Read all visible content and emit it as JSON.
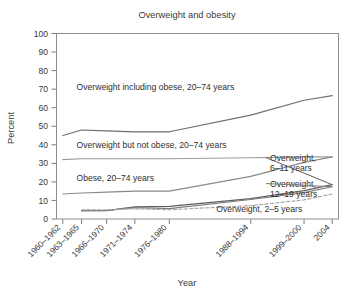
{
  "chart_data": {
    "type": "line",
    "title": "Overweight and obesity",
    "xlabel": "Year",
    "ylabel": "Percent",
    "ylim": [
      0,
      100
    ],
    "ytick_step": 10,
    "yticks": [
      "0",
      "10",
      "20",
      "30",
      "40",
      "50",
      "60",
      "70",
      "80",
      "90",
      "100"
    ],
    "grid": false,
    "legend_position": "inline-annotations",
    "categories": [
      "1960–1962",
      "1963–1965",
      "1966–1970",
      "1971–1974",
      "1976–1980",
      "1988–1994",
      "1999–2000",
      "2004"
    ],
    "x_positions": [
      1961,
      1964,
      1968,
      1972.5,
      1978,
      1991,
      1999.5,
      2004
    ],
    "xlim": [
      1960,
      2005
    ],
    "series": [
      {
        "name": "Overweight including obese, 20–74 years",
        "style": "solid",
        "color": "#6e6e6e",
        "x": [
          1961,
          1964,
          1968,
          1972.5,
          1978,
          1991,
          1999.5,
          2004
        ],
        "values": [
          45,
          48,
          47.5,
          47,
          47,
          56,
          64,
          66.5
        ]
      },
      {
        "name": "Overweight but not obese, 20–74 years",
        "style": "solid",
        "color": "#9a9a9a",
        "x": [
          1961,
          1964,
          1968,
          1972.5,
          1978,
          1991,
          1999.5,
          2004
        ],
        "values": [
          32,
          32.5,
          32.5,
          32.5,
          32.5,
          33,
          33.5,
          33.5
        ]
      },
      {
        "name": "Obese, 20–74 years",
        "style": "solid",
        "color": "#8a8a8a",
        "x": [
          1961,
          1964,
          1968,
          1972.5,
          1978,
          1991,
          1999.5,
          2004
        ],
        "values": [
          13.5,
          14,
          14.5,
          15,
          15,
          23,
          30.5,
          33.5
        ]
      },
      {
        "name": "Overweight, 6–11 years",
        "style": "solid",
        "color": "#5d5d5d",
        "x": [
          1964,
          1968,
          1972.5,
          1978,
          1991,
          1999.5,
          2004
        ],
        "values": [
          4.5,
          4.5,
          6.5,
          6.8,
          11,
          15.3,
          18.5
        ]
      },
      {
        "name": "Overweight, 12–19 years",
        "style": "solid",
        "color": "#7d7d7d",
        "x": [
          1964,
          1968,
          1972.5,
          1978,
          1991,
          1999.5,
          2004
        ],
        "values": [
          4.5,
          4.6,
          6.1,
          5.6,
          10.5,
          14.2,
          17.4
        ]
      },
      {
        "name": "Overweight, 2–5 years",
        "style": "dashed",
        "color": "#a5a5a5",
        "x": [
          1964,
          1968,
          1972.5,
          1978,
          1991,
          1999.5,
          2004
        ],
        "values": [
          5,
          5,
          5.5,
          5,
          7.2,
          10.3,
          13.5
        ]
      }
    ],
    "annotations": [
      {
        "text": "Overweight including obese, 20–74 years",
        "x": 1963.2,
        "y": 69.5,
        "anchor": "start"
      },
      {
        "text": "Overweight but not obese, 20–74 years",
        "x": 1963.2,
        "y": 38.5,
        "anchor": "start"
      },
      {
        "text": "Obese, 20–74 years",
        "x": 1963.2,
        "y": 20.5,
        "anchor": "start"
      },
      {
        "text": "Overweight, 2–5 years",
        "x": 1985.5,
        "y": 4.0,
        "anchor": "start"
      }
    ],
    "right_labels": [
      {
        "line1": "Overweight,",
        "line2": "6–11 years",
        "y": 31.5
      },
      {
        "line1": "Overweight,",
        "line2": "12–19 years",
        "y": 17.5
      }
    ]
  }
}
